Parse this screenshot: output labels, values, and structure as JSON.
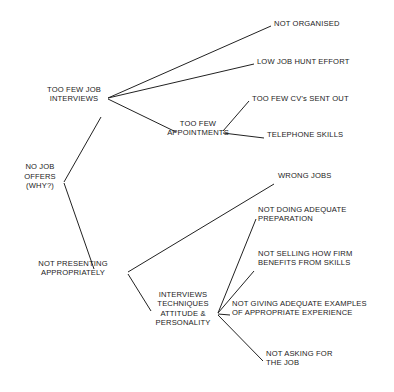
{
  "diagram": {
    "type": "tree-diagram",
    "background_color": "#ffffff",
    "line_color": "#222222",
    "text_color": "#1b1b1b",
    "nodes": [
      {
        "id": "no_job_offers",
        "label": "NO JOB\nOFFERS\n(WHY?)",
        "x": 40,
        "y": 190,
        "align": "center"
      },
      {
        "id": "too_few_interviews",
        "label": "TOO FEW JOB\nINTERVIEWS",
        "x": 74,
        "y": 103,
        "align": "center"
      },
      {
        "id": "not_organised",
        "label": "NOT ORGANISED",
        "x": 274,
        "y": 28,
        "align": "left"
      },
      {
        "id": "low_job_hunt_effort",
        "label": "LOW JOB HUNT EFFORT",
        "x": 257,
        "y": 66,
        "align": "left"
      },
      {
        "id": "too_few_appointments",
        "label": "TOO FEW\nAPPOINTMENTS",
        "x": 198,
        "y": 137,
        "align": "center"
      },
      {
        "id": "too_few_cvs",
        "label": "TOO FEW CV's SENT OUT",
        "x": 252,
        "y": 103,
        "align": "left"
      },
      {
        "id": "telephone_skills",
        "label": "TELEPHONE SKILLS",
        "x": 267,
        "y": 139,
        "align": "left"
      },
      {
        "id": "not_presenting",
        "label": "NOT PRESENTING\nAPPROPRIATELY",
        "x": 73,
        "y": 277,
        "align": "center"
      },
      {
        "id": "wrong_jobs",
        "label": "WRONG JOBS",
        "x": 278,
        "y": 180,
        "align": "left"
      },
      {
        "id": "interviews_techniques",
        "label": "INTERVIEWS\nTECHNIQUES\nATTITUDE &\nPERSONALITY",
        "x": 183,
        "y": 327,
        "align": "center"
      },
      {
        "id": "not_doing_prep",
        "label": "NOT DOING ADEQUATE\nPREPARATION",
        "x": 258,
        "y": 223,
        "align": "left"
      },
      {
        "id": "not_selling",
        "label": "NOT SELLING HOW FIRM\nBENEFITS FROM SKILLS",
        "x": 258,
        "y": 267,
        "align": "left"
      },
      {
        "id": "not_giving_examples",
        "label": "NOT GIVING ADEQUATE EXAMPLES\nOF APPROPRIATE EXPERIENCE",
        "x": 232,
        "y": 317,
        "align": "left"
      },
      {
        "id": "not_asking",
        "label": "NOT ASKING FOR\nTHE JOB",
        "x": 266,
        "y": 367,
        "align": "left"
      }
    ],
    "edges": [
      {
        "from": "no_job_offers",
        "to": "too_few_interviews",
        "x1": 64,
        "y1": 182,
        "x2": 101,
        "y2": 117
      },
      {
        "from": "no_job_offers",
        "to": "not_presenting",
        "x1": 64,
        "y1": 183,
        "x2": 94,
        "y2": 269
      },
      {
        "from": "too_few_interviews",
        "to": "not_organised",
        "x1": 108,
        "y1": 98,
        "x2": 271,
        "y2": 26
      },
      {
        "from": "too_few_interviews",
        "to": "low_job_hunt_effort",
        "x1": 108,
        "y1": 98,
        "x2": 254,
        "y2": 64
      },
      {
        "from": "too_few_interviews",
        "to": "too_few_appointments",
        "x1": 108,
        "y1": 99,
        "x2": 176,
        "y2": 132
      },
      {
        "from": "too_few_appointments",
        "to": "too_few_cvs",
        "x1": 223,
        "y1": 131,
        "x2": 249,
        "y2": 101
      },
      {
        "from": "too_few_appointments",
        "to": "telephone_skills",
        "x1": 223,
        "y1": 133,
        "x2": 264,
        "y2": 138
      },
      {
        "from": "not_presenting",
        "to": "wrong_jobs",
        "x1": 128,
        "y1": 272,
        "x2": 274,
        "y2": 184
      },
      {
        "from": "not_presenting",
        "to": "interviews_techniques",
        "x1": 128,
        "y1": 274,
        "x2": 151,
        "y2": 311
      },
      {
        "from": "interviews_techniques",
        "to": "not_doing_prep",
        "x1": 218,
        "y1": 313,
        "x2": 256,
        "y2": 219
      },
      {
        "from": "interviews_techniques",
        "to": "not_selling",
        "x1": 218,
        "y1": 313,
        "x2": 254,
        "y2": 271
      },
      {
        "from": "interviews_techniques",
        "to": "not_giving_examples",
        "x1": 218,
        "y1": 314,
        "x2": 230,
        "y2": 315
      },
      {
        "from": "interviews_techniques",
        "to": "not_asking",
        "x1": 218,
        "y1": 315,
        "x2": 263,
        "y2": 361
      }
    ]
  }
}
